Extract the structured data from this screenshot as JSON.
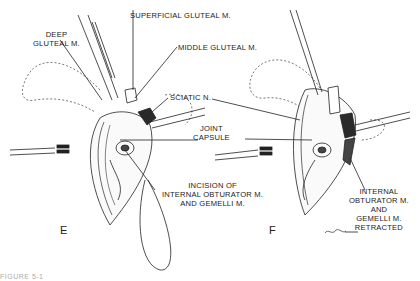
{
  "figure": {
    "panels": [
      {
        "id": "E",
        "letter": "E",
        "labels": {
          "deep_gluteal_1": "DEEP",
          "deep_gluteal_2": "GLUTEAL M.",
          "superficial_gluteal": "SUPERFICIAL GLUTEAL M.",
          "middle_gluteal": "MIDDLE GLUTEAL M.",
          "sciatic": "SCIATIC N.",
          "joint_capsule_1": "JOINT",
          "joint_capsule_2": "CAPSULE",
          "incision_1": "INCISION OF",
          "incision_2": "INTERNAL OBTURATOR M.",
          "incision_3": "AND GEMELLI M."
        }
      },
      {
        "id": "F",
        "letter": "F",
        "labels": {
          "retracted_1": "INTERNAL",
          "retracted_2": "OBTURATOR M.",
          "retracted_3": "AND",
          "retracted_4": "GEMELLI M.",
          "retracted_5": "RETRACTED"
        }
      }
    ],
    "caption_partial": "FIGURE 5-1",
    "colors": {
      "ink": "#1a1a1a",
      "background": "#ffffff",
      "shade": "#2a2a2a"
    }
  }
}
